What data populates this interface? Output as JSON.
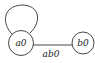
{
  "diagram": {
    "type": "state-graph",
    "nodes": [
      {
        "id": "a0",
        "label": "a0"
      },
      {
        "id": "b0",
        "label": "b0"
      }
    ],
    "edges": [
      {
        "from": "a0",
        "to": "a0",
        "label": "",
        "kind": "self-loop"
      },
      {
        "from": "a0",
        "to": "b0",
        "label": "ab0"
      }
    ],
    "colors": {
      "stroke": "#333333",
      "background": "#ffffff"
    }
  }
}
